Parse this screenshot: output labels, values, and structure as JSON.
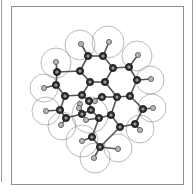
{
  "figure": {
    "colors": {
      "carbon": "#2e2e2e",
      "hydrogen": "#b5b5b5",
      "bond": "#555555",
      "surface": "#8a8a8a",
      "frame": "#8e8e8e"
    },
    "carbon_atoms": [
      [
        88,
        56
      ],
      [
        103,
        56
      ],
      [
        80,
        71
      ],
      [
        113,
        68
      ],
      [
        129,
        67
      ],
      [
        57,
        72
      ],
      [
        90,
        82
      ],
      [
        105,
        82
      ],
      [
        56,
        85
      ],
      [
        137,
        80
      ],
      [
        65,
        96
      ],
      [
        82,
        95
      ],
      [
        102,
        97
      ],
      [
        117,
        97
      ],
      [
        130,
        96
      ],
      [
        60,
        110
      ],
      [
        89,
        101
      ],
      [
        91,
        110
      ],
      [
        82,
        114
      ],
      [
        99,
        118
      ],
      [
        111,
        115
      ],
      [
        143,
        109
      ],
      [
        66,
        118
      ],
      [
        120,
        127
      ],
      [
        135,
        124
      ],
      [
        92,
        137
      ],
      [
        100,
        147
      ]
    ],
    "hydrogen_atoms": [
      [
        81,
        44
      ],
      [
        109,
        42
      ],
      [
        138,
        55
      ],
      [
        56,
        62
      ],
      [
        151,
        79
      ],
      [
        44,
        88
      ],
      [
        153,
        108
      ],
      [
        140,
        130
      ],
      [
        46,
        111
      ],
      [
        61,
        125
      ],
      [
        80,
        104
      ],
      [
        79,
        108
      ],
      [
        86,
        120
      ],
      [
        95,
        101
      ],
      [
        82,
        141
      ],
      [
        118,
        149
      ],
      [
        94,
        158
      ]
    ],
    "bonds": [
      [
        [
          88,
          56
        ],
        [
          103,
          56
        ]
      ],
      [
        [
          88,
          56
        ],
        [
          80,
          71
        ]
      ],
      [
        [
          103,
          56
        ],
        [
          113,
          68
        ]
      ],
      [
        [
          113,
          68
        ],
        [
          129,
          67
        ]
      ],
      [
        [
          129,
          67
        ],
        [
          137,
          80
        ]
      ],
      [
        [
          80,
          71
        ],
        [
          90,
          82
        ]
      ],
      [
        [
          80,
          71
        ],
        [
          57,
          72
        ]
      ],
      [
        [
          57,
          72
        ],
        [
          56,
          85
        ]
      ],
      [
        [
          56,
          85
        ],
        [
          65,
          96
        ]
      ],
      [
        [
          90,
          82
        ],
        [
          105,
          82
        ]
      ],
      [
        [
          105,
          82
        ],
        [
          113,
          68
        ]
      ],
      [
        [
          105,
          82
        ],
        [
          117,
          97
        ]
      ],
      [
        [
          137,
          80
        ],
        [
          130,
          96
        ]
      ],
      [
        [
          130,
          96
        ],
        [
          143,
          109
        ]
      ],
      [
        [
          117,
          97
        ],
        [
          130,
          96
        ]
      ],
      [
        [
          65,
          96
        ],
        [
          82,
          95
        ]
      ],
      [
        [
          82,
          95
        ],
        [
          90,
          82
        ]
      ],
      [
        [
          65,
          96
        ],
        [
          60,
          110
        ]
      ],
      [
        [
          60,
          110
        ],
        [
          66,
          118
        ]
      ],
      [
        [
          82,
          95
        ],
        [
          89,
          101
        ]
      ],
      [
        [
          89,
          101
        ],
        [
          91,
          110
        ]
      ],
      [
        [
          91,
          110
        ],
        [
          82,
          114
        ]
      ],
      [
        [
          91,
          110
        ],
        [
          99,
          118
        ]
      ],
      [
        [
          99,
          118
        ],
        [
          111,
          115
        ]
      ],
      [
        [
          111,
          115
        ],
        [
          117,
          97
        ]
      ],
      [
        [
          143,
          109
        ],
        [
          135,
          124
        ]
      ],
      [
        [
          135,
          124
        ],
        [
          120,
          127
        ]
      ],
      [
        [
          120,
          127
        ],
        [
          111,
          115
        ]
      ],
      [
        [
          102,
          97
        ],
        [
          89,
          101
        ]
      ],
      [
        [
          102,
          97
        ],
        [
          117,
          97
        ]
      ],
      [
        [
          66,
          118
        ],
        [
          82,
          114
        ]
      ],
      [
        [
          92,
          137
        ],
        [
          99,
          118
        ]
      ],
      [
        [
          92,
          137
        ],
        [
          100,
          147
        ]
      ],
      [
        [
          100,
          147
        ],
        [
          120,
          127
        ]
      ],
      [
        [
          88,
          56
        ],
        [
          81,
          44
        ]
      ],
      [
        [
          103,
          56
        ],
        [
          109,
          42
        ]
      ],
      [
        [
          129,
          67
        ],
        [
          138,
          55
        ]
      ],
      [
        [
          57,
          72
        ],
        [
          56,
          62
        ]
      ],
      [
        [
          137,
          80
        ],
        [
          151,
          79
        ]
      ],
      [
        [
          56,
          85
        ],
        [
          44,
          88
        ]
      ],
      [
        [
          143,
          109
        ],
        [
          153,
          108
        ]
      ],
      [
        [
          135,
          124
        ],
        [
          140,
          130
        ]
      ],
      [
        [
          60,
          110
        ],
        [
          46,
          111
        ]
      ],
      [
        [
          66,
          118
        ],
        [
          61,
          125
        ]
      ],
      [
        [
          82,
          114
        ],
        [
          80,
          104
        ]
      ],
      [
        [
          82,
          114
        ],
        [
          79,
          108
        ]
      ],
      [
        [
          99,
          118
        ],
        [
          86,
          120
        ]
      ],
      [
        [
          89,
          101
        ],
        [
          95,
          101
        ]
      ],
      [
        [
          92,
          137
        ],
        [
          82,
          141
        ]
      ],
      [
        [
          100,
          147
        ],
        [
          118,
          149
        ]
      ],
      [
        [
          100,
          147
        ],
        [
          94,
          158
        ]
      ]
    ],
    "surface_spheres": [
      [
        80,
        45,
        15
      ],
      [
        108,
        42,
        16
      ],
      [
        137,
        56,
        15
      ],
      [
        56,
        63,
        15
      ],
      [
        150,
        80,
        14
      ],
      [
        44,
        88,
        14
      ],
      [
        152,
        108,
        14
      ],
      [
        140,
        129,
        14
      ],
      [
        46,
        111,
        14
      ],
      [
        62,
        126,
        14
      ],
      [
        82,
        141,
        16
      ],
      [
        118,
        148,
        14
      ],
      [
        95,
        158,
        15
      ],
      [
        90,
        115,
        18
      ]
    ]
  }
}
